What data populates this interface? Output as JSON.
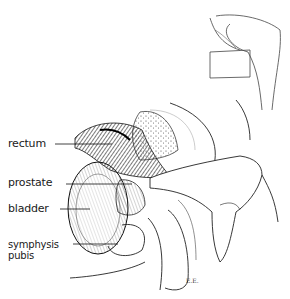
{
  "figure": {
    "type": "anatomical illustration",
    "labels": [
      {
        "id": "rectum",
        "text": "rectum"
      },
      {
        "id": "prostate",
        "text": "prostate"
      },
      {
        "id": "bladder",
        "text": "bladder"
      },
      {
        "id": "symphysis",
        "text": "symphysis"
      },
      {
        "id": "pubis",
        "text": "pubis"
      }
    ],
    "signature": "E.E."
  }
}
